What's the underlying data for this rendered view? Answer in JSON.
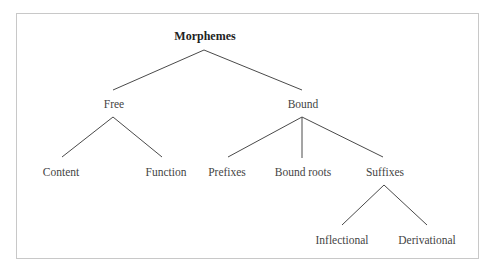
{
  "diagram": {
    "type": "tree",
    "title": "Morphemes",
    "nodes": {
      "root": {
        "label": "Morphemes",
        "x": 205,
        "y": 29
      },
      "free": {
        "label": "Free",
        "x": 114,
        "y": 97
      },
      "bound": {
        "label": "Bound",
        "x": 303,
        "y": 97
      },
      "content": {
        "label": "Content",
        "x": 61,
        "y": 165
      },
      "function": {
        "label": "Function",
        "x": 166,
        "y": 165
      },
      "prefixes": {
        "label": "Prefixes",
        "x": 227,
        "y": 165
      },
      "bound_roots": {
        "label": "Bound roots",
        "x": 303,
        "y": 165
      },
      "suffixes": {
        "label": "Suffixes",
        "x": 385,
        "y": 165
      },
      "inflectional": {
        "label": "Inflectional",
        "x": 342,
        "y": 233
      },
      "derivational": {
        "label": "Derivational",
        "x": 427,
        "y": 233
      }
    },
    "edges": [
      {
        "from": "root",
        "to": "free"
      },
      {
        "from": "root",
        "to": "bound"
      },
      {
        "from": "free",
        "to": "content"
      },
      {
        "from": "free",
        "to": "function"
      },
      {
        "from": "bound",
        "to": "prefixes"
      },
      {
        "from": "bound",
        "to": "bound_roots"
      },
      {
        "from": "bound",
        "to": "suffixes"
      },
      {
        "from": "suffixes",
        "to": "inflectional"
      },
      {
        "from": "suffixes",
        "to": "derivational"
      }
    ]
  },
  "colors": {
    "frame_border": "#c8c8c8",
    "edge": "#4a4a4a",
    "root_text": "#222222",
    "node_text": "#444444"
  }
}
